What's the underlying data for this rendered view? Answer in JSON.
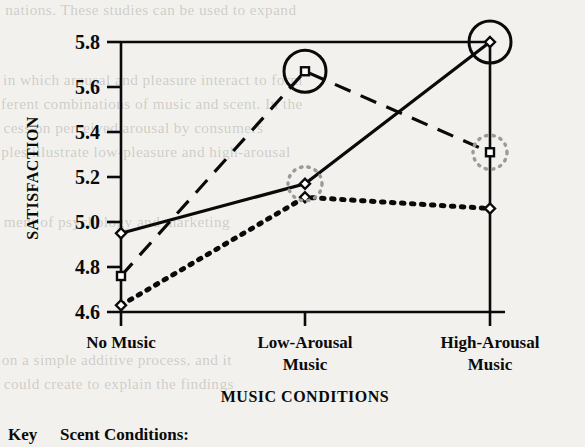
{
  "figure": {
    "key_label": "Key",
    "legend_heading": "Scent Conditions:"
  },
  "chart_data": {
    "type": "line",
    "title": "",
    "xlabel": "MUSIC CONDITIONS",
    "ylabel": "SATISFACTION",
    "categories": [
      "No Music",
      "Low-Arousal Music",
      "High-Arousal Music"
    ],
    "category_lines": [
      [
        "No Music"
      ],
      [
        "Low-Arousal",
        "Music"
      ],
      [
        "High-Arousal",
        "Music"
      ]
    ],
    "ylim": [
      4.6,
      5.8
    ],
    "yticks": [
      5.8,
      5.6,
      5.4,
      5.2,
      5.0,
      4.8,
      4.6
    ],
    "ytick_labels": [
      "5.8",
      "5.6",
      "5.4",
      "5.2",
      "5.0",
      "4.8",
      "4.6"
    ],
    "grid": false,
    "legend_position": "below-plot",
    "series": [
      {
        "name": "series-solid",
        "style": "solid",
        "marker": "diamond",
        "values": [
          4.95,
          5.17,
          5.8
        ]
      },
      {
        "name": "series-dashed",
        "style": "dashed",
        "marker": "square",
        "values": [
          4.76,
          5.67,
          5.31
        ]
      },
      {
        "name": "series-dotted",
        "style": "dotted",
        "marker": "diamond",
        "values": [
          4.63,
          5.11,
          5.06
        ]
      }
    ],
    "annotations": [
      {
        "type": "solid-circle",
        "series": "series-dashed",
        "category": "Low-Arousal Music",
        "value": 5.67
      },
      {
        "type": "solid-circle",
        "series": "series-solid",
        "category": "High-Arousal Music",
        "value": 5.8
      },
      {
        "type": "dotted-circle",
        "series": "series-solid",
        "category": "Low-Arousal Music",
        "value": 5.17
      },
      {
        "type": "dotted-circle",
        "series": "series-dashed",
        "category": "High-Arousal Music",
        "value": 5.31
      }
    ]
  },
  "bleed_text": {
    "line_top": "nations. These studies can be used to expand",
    "line_2": "in which arousal and pleasure interact to form",
    "line_3": "ferent combinations of music and scent. In the",
    "line_4": "cess on perceived arousal by consumers",
    "line_5": "ples illustrate low-pleasure and high-arousal",
    "line_6": "ment of psychology and marketing",
    "line_7": "on a simple additive process, and it",
    "line_8": "could create to explain the findings"
  }
}
